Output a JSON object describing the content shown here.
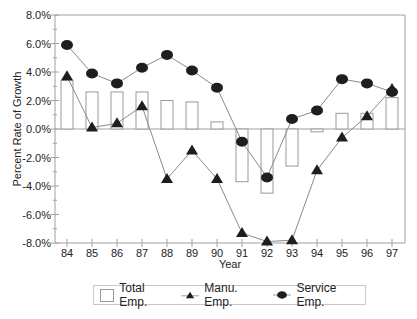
{
  "chart_data": {
    "type": "bar+line",
    "title": "",
    "xlabel": "Year",
    "ylabel": "Percent Rate of Growth",
    "categories": [
      "84",
      "85",
      "86",
      "87",
      "88",
      "89",
      "90",
      "91",
      "92",
      "93",
      "94",
      "95",
      "96",
      "97"
    ],
    "ylim": [
      -8,
      8
    ],
    "yticks": [
      "8.0%",
      "6.0%",
      "4.0%",
      "2.0%",
      "0.0%",
      "-2.0%",
      "-4.0%",
      "-6.0%",
      "-8.0%"
    ],
    "grid": false,
    "legend_position": "bottom",
    "series": [
      {
        "name": "Total Emp.",
        "kind": "bar",
        "values": [
          3.4,
          2.6,
          2.6,
          2.6,
          2.0,
          1.9,
          0.5,
          -3.7,
          -4.5,
          -2.6,
          -0.2,
          1.1,
          1.1,
          2.2
        ]
      },
      {
        "name": "Manu. Emp.",
        "kind": "line",
        "marker": "triangle",
        "values": [
          3.7,
          0.1,
          0.4,
          1.6,
          -3.5,
          -1.5,
          -3.5,
          -7.3,
          -7.9,
          -7.8,
          -2.9,
          -0.6,
          0.9,
          2.8
        ]
      },
      {
        "name": "Service Emp.",
        "kind": "line",
        "marker": "circle",
        "values": [
          5.9,
          3.9,
          3.2,
          4.3,
          5.2,
          4.1,
          2.9,
          -0.9,
          -3.4,
          0.7,
          1.3,
          3.5,
          3.2,
          2.6
        ]
      }
    ]
  },
  "legend": {
    "total": "Total Emp.",
    "manu": "Manu. Emp.",
    "service": "Service Emp."
  },
  "colors": {
    "bar_stroke": "#999999",
    "line": "#8a8a8a",
    "marker": "#1e1e1e",
    "axis": "#a0a0a0"
  }
}
